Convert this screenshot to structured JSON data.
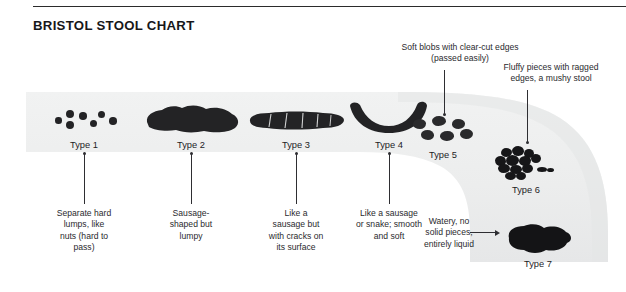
{
  "header": {
    "title": "BRISTOL STOOL CHART"
  },
  "colors": {
    "band": "#eceded",
    "band_shadow": "#e2e3e4",
    "stool": "#1f1f22",
    "text": "#2a2a2e",
    "title": "#17171a",
    "rule": "#2b2b2b",
    "background": "#ffffff"
  },
  "types": [
    {
      "id": "type-1",
      "label": "Type 1",
      "caption": "Separate hard lumps, like nuts (hard to pass)",
      "caption_lines": [
        "Separate hard",
        "lumps, like",
        "nuts (hard to",
        "pass)"
      ],
      "shape": "separate-hard-lumps"
    },
    {
      "id": "type-2",
      "label": "Type 2",
      "caption": "Sausage-shaped but lumpy",
      "caption_lines": [
        "Sausage-",
        "shaped but",
        "lumpy"
      ],
      "shape": "lumpy-sausage"
    },
    {
      "id": "type-3",
      "label": "Type 3",
      "caption": "Like a sausage but with cracks on its surface",
      "caption_lines": [
        "Like a",
        "sausage but",
        "with cracks on",
        "its surface"
      ],
      "shape": "cracked-sausage"
    },
    {
      "id": "type-4",
      "label": "Type 4",
      "caption": "Like a sausage or snake; smooth and soft",
      "caption_lines": [
        "Like a sausage",
        "or snake; smooth",
        "and soft"
      ],
      "shape": "smooth-snake"
    },
    {
      "id": "type-5",
      "label": "Type 5",
      "caption": "Soft blobs with clear-cut edges (passed easily)",
      "caption_lines": [
        "Soft blobs with clear-cut edges",
        "(passed easily)"
      ],
      "shape": "soft-blobs"
    },
    {
      "id": "type-6",
      "label": "Type 6",
      "caption": "Fluffy pieces with ragged edges, a mushy stool",
      "caption_lines": [
        "Fluffy pieces with ragged",
        "edges, a mushy stool"
      ],
      "shape": "fluffy-mushy"
    },
    {
      "id": "type-7",
      "label": "Type 7",
      "caption": "Watery, no solid pieces, entirely liquid",
      "caption_lines": [
        "Watery, no",
        "solid pieces,",
        "entirely liquid"
      ],
      "shape": "watery-liquid"
    }
  ]
}
